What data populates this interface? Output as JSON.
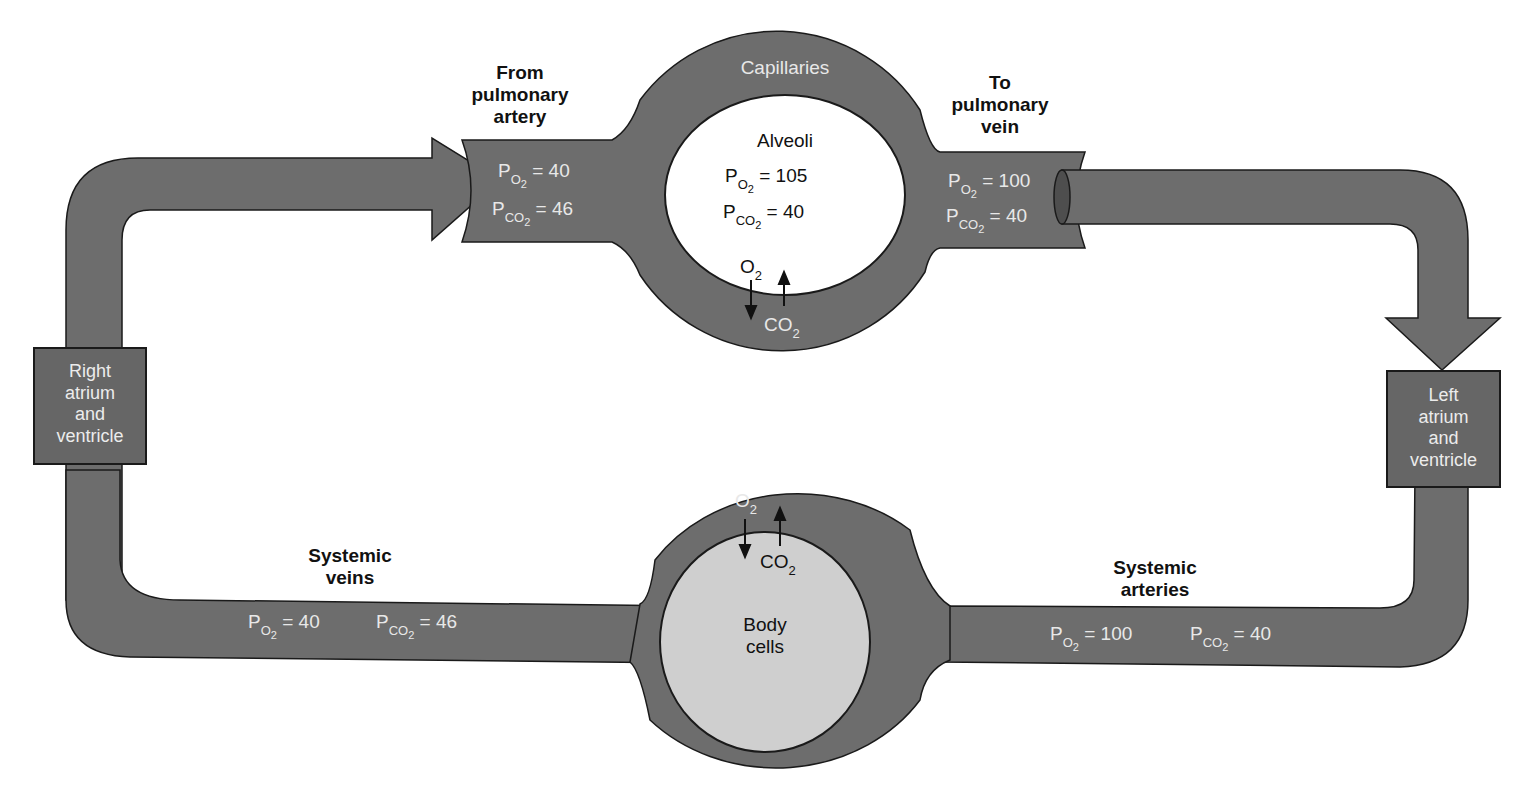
{
  "diagram": {
    "colors": {
      "vessel_fill": "#6d6d6d",
      "outline": "#1a1a1a",
      "alveoli_fill": "#ffffff",
      "body_cells_fill": "#cfcfcf",
      "light_text": "#e8e8e8",
      "dark_text": "#111111"
    },
    "pulmonary": {
      "from_label": [
        "From",
        "pulmonary",
        "artery"
      ],
      "to_label": [
        "To",
        "pulmonary",
        "vein"
      ],
      "capillaries_label": "Capillaries",
      "alveoli_label": "Alveoli",
      "inlet": {
        "po2_label": "P",
        "po2_sub": "O",
        "po2_subsub": "2",
        "po2_value": "= 40",
        "pco2_label": "P",
        "pco2_sub": "CO",
        "pco2_subsub": "2",
        "pco2_value": "= 46"
      },
      "alveoli": {
        "po2_value": "= 105",
        "pco2_value": "= 40"
      },
      "outlet": {
        "po2_value": "= 100",
        "pco2_value": "= 40"
      },
      "o2_label": "O",
      "o2_sub": "2",
      "co2_label": "CO",
      "co2_sub": "2"
    },
    "heart": {
      "right": [
        "Right",
        "atrium",
        "and",
        "ventricle"
      ],
      "left": [
        "Left",
        "atrium",
        "and",
        "ventricle"
      ]
    },
    "systemic": {
      "veins_label": [
        "Systemic",
        "veins"
      ],
      "arteries_label": [
        "Systemic",
        "arteries"
      ],
      "body_cells_label": [
        "Body",
        "cells"
      ],
      "veins": {
        "po2_value": "= 40",
        "pco2_value": "= 46"
      },
      "arteries": {
        "po2_value": "= 100",
        "pco2_value": "= 40"
      },
      "o2_label": "O",
      "o2_sub": "2",
      "co2_label": "CO",
      "co2_sub": "2"
    },
    "symbols": {
      "P": "P",
      "O": "O",
      "CO": "CO",
      "two": "2"
    }
  }
}
